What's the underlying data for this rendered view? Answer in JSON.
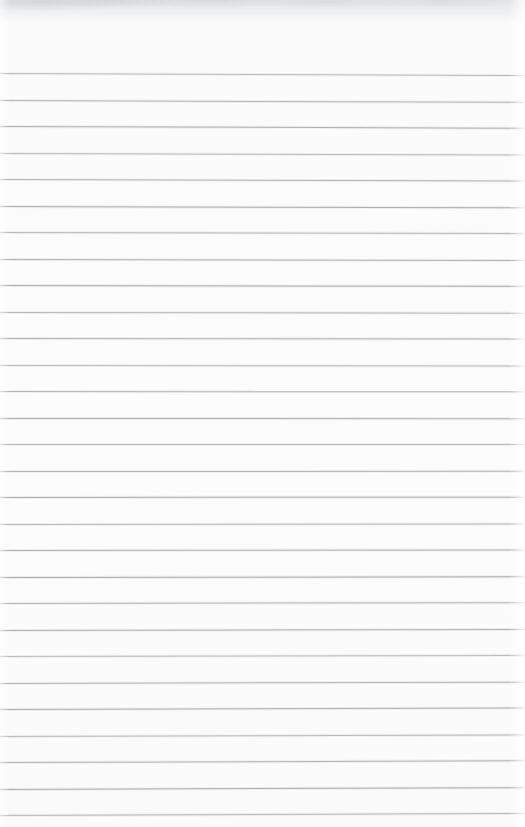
{
  "document": {
    "kind": "scanned-blank-ruled-page",
    "page_width": 525,
    "page_height": 827,
    "background_color": "#fbfbfb",
    "rule_color": "#a7adb2",
    "text_content": "",
    "visible_text_items": [],
    "handwriting": "none",
    "header_text": "",
    "footer_text": "",
    "page_number": "",
    "margin_rule": "none"
  },
  "ruling": {
    "line_count": 29,
    "first_line_y": 73,
    "line_spacing": 26.5,
    "line_thickness": 1,
    "left_inset": 0,
    "right_inset": 0,
    "slant_degrees": -0.22,
    "slant_description": "lines rise very slightly toward the right in the upper half and fall slightly in the lower half"
  },
  "artifacts": {
    "top_edge_smudge": "faint grey scan shadow across the top 20px",
    "right_edge_highlight": "faint lighter vertical band at the right margin",
    "left_edge_highlight": "faint lighter vertical band at the left margin"
  }
}
